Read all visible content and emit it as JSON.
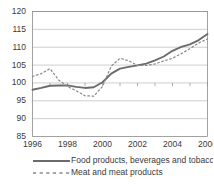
{
  "chart_data": {
    "type": "line",
    "title": "",
    "subtitle": "",
    "xlabel": "",
    "ylabel": "",
    "xlim": [
      1996,
      2006
    ],
    "ylim": [
      85,
      120
    ],
    "y_ticks": [
      85,
      90,
      95,
      100,
      105,
      110,
      115,
      120
    ],
    "x_ticks": [
      1996,
      1998,
      2000,
      2002,
      2004,
      2006
    ],
    "x_tick_labels": [
      "1996",
      "1998",
      "2000",
      "2002",
      "2004",
      "2006"
    ],
    "y_tick_labels": [
      "85",
      "90",
      "95",
      "100",
      "105",
      "110",
      "115",
      "120"
    ],
    "grid": true,
    "legend_position": "bottom",
    "x": [
      1996,
      1996.5,
      1997,
      1997.5,
      1998,
      1998.5,
      1999,
      1999.5,
      2000,
      2000.5,
      2001,
      2001.5,
      2002,
      2002.5,
      2003,
      2003.5,
      2004,
      2004.5,
      2005,
      2005.5,
      2006
    ],
    "series": [
      {
        "name": "Food products, beverages and tobacco",
        "style": "solid",
        "color": "#6b6b6b",
        "values": [
          98.1,
          98.6,
          99.2,
          99.3,
          99.3,
          98.9,
          98.6,
          98.8,
          100.2,
          102.6,
          104.0,
          104.5,
          104.9,
          105.4,
          106.3,
          107.4,
          109.0,
          110.1,
          110.8,
          112.0,
          113.7
        ]
      },
      {
        "name": "Meat and meat products",
        "style": "dashed",
        "color": "#8a8a8a",
        "values": [
          101.8,
          102.6,
          104.0,
          100.8,
          99.0,
          97.8,
          96.4,
          96.3,
          99.0,
          104.7,
          106.9,
          106.2,
          104.9,
          104.9,
          105.3,
          106.2,
          106.9,
          108.2,
          109.6,
          111.2,
          112.3
        ]
      }
    ]
  },
  "legend": {
    "items": [
      {
        "label": "Food products, beverages and tobacco",
        "style": "solid"
      },
      {
        "label": "Meat and meat products",
        "style": "dashed"
      }
    ]
  },
  "colors": {
    "series_solid": "#6b6b6b",
    "series_dashed": "#8a8a8a",
    "grid": "#b8b8b8",
    "axis": "#8c8c8c",
    "text": "#3a3a3a",
    "background": "#ffffff"
  }
}
